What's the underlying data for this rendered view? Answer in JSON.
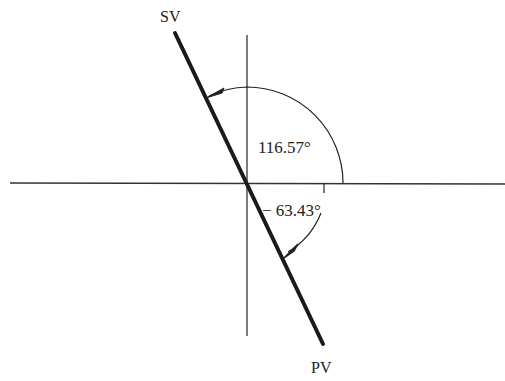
{
  "diagram": {
    "labels": {
      "top_line": "SV",
      "bottom_line": "PV",
      "upper_angle": "116.57°",
      "lower_angle": "− 63.43°"
    },
    "colors": {
      "line": "#1a1a1a",
      "axis": "#333333",
      "background": "#ffffff"
    }
  }
}
